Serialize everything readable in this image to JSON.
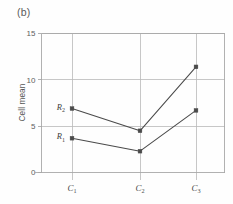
{
  "figure": {
    "panel_label": "(b)"
  },
  "chart_data": {
    "type": "line",
    "title": "",
    "panel": "(b)",
    "xlabel": "",
    "ylabel": "Cell mean",
    "categories": [
      "C1",
      "C2",
      "C3"
    ],
    "category_labels": [
      {
        "base": "C",
        "sub": "1"
      },
      {
        "base": "C",
        "sub": "2"
      },
      {
        "base": "C",
        "sub": "3"
      }
    ],
    "series": [
      {
        "name": "R2",
        "label_base": "R",
        "label_sub": "2",
        "values": [
          6.9,
          4.5,
          11.4
        ],
        "color": "#4a4a4a",
        "marker": "square"
      },
      {
        "name": "R1",
        "label_base": "R",
        "label_sub": "1",
        "values": [
          3.7,
          2.3,
          6.7
        ],
        "color": "#4a4a4a",
        "marker": "square"
      }
    ],
    "ylim": [
      0,
      15
    ],
    "yticks": [
      0,
      5,
      10,
      15
    ],
    "ytick_labels": [
      "0",
      "5",
      "10",
      "15"
    ],
    "grid": true,
    "grid_axis": "both",
    "legend": "inline-labels",
    "legend_position": "left-of-first-point",
    "axis_color": "#a8a8a8",
    "grid_color": "#b9b9b9",
    "background": "#ffffff"
  }
}
